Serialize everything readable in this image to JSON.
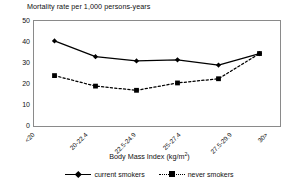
{
  "chart_data": {
    "type": "line",
    "title": "Mortality rate per 1,000 persons-years",
    "xlabel": "Body Mass Index (kg/m²)",
    "ylabel": "",
    "categories": [
      "<20",
      "20-22.4",
      "22.5-24.9",
      "25-27.4",
      "27.5-29.9",
      "30>"
    ],
    "series": [
      {
        "name": "current smokers",
        "marker": "diamond",
        "linestyle": "solid",
        "color": "#000000",
        "values": [
          40.5,
          33.0,
          31.0,
          31.5,
          29.0,
          34.5
        ]
      },
      {
        "name": "never smokers",
        "marker": "square",
        "linestyle": "dotted",
        "color": "#000000",
        "values": [
          24.0,
          19.0,
          17.0,
          20.5,
          22.5,
          34.5
        ]
      }
    ],
    "ylim": [
      0,
      50
    ],
    "yticks": [
      0,
      10,
      20,
      30,
      40,
      50
    ],
    "ytick_labels": [
      "0",
      "10",
      "20",
      "30",
      "40",
      "50"
    ],
    "grid": false,
    "legend_position": "bottom"
  },
  "axis": {
    "x_title_main": "Body Mass Index (kg/m",
    "x_title_sup": "2",
    "x_title_close": ")"
  },
  "legend": {
    "entries": [
      {
        "label": "current smokers"
      },
      {
        "label": "never smokers"
      }
    ]
  }
}
